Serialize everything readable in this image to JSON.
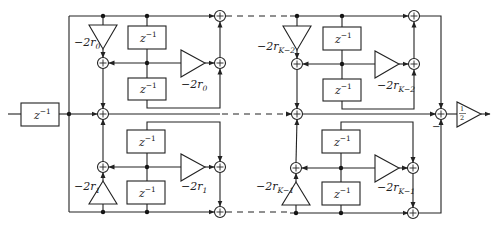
{
  "diagram": {
    "delay_label": "z",
    "delay_exp": "−1",
    "input_delay": {
      "base": "z",
      "exp": "−1"
    },
    "sections": [
      {
        "id": "upper-first",
        "delay_top": {
          "base": "z",
          "exp": "−1"
        },
        "delay_bottom": {
          "base": "z",
          "exp": "−1"
        },
        "gain_tri": {
          "prefix": "−2r",
          "sub": "0"
        },
        "gain_right": {
          "prefix": "−2r",
          "sub": "0"
        }
      },
      {
        "id": "upper-last",
        "delay_top": {
          "base": "z",
          "exp": "−1"
        },
        "delay_bottom": {
          "base": "z",
          "exp": "−1"
        },
        "gain_tri": {
          "prefix": "−2r",
          "sub": "K−2"
        },
        "gain_right": {
          "prefix": "−2r",
          "sub": "K−2"
        }
      },
      {
        "id": "lower-first",
        "delay_top": {
          "base": "z",
          "exp": "−1"
        },
        "delay_bottom": {
          "base": "z",
          "exp": "−1"
        },
        "gain_tri": {
          "prefix": "−2r",
          "sub": "1"
        },
        "gain_right": {
          "prefix": "−2r",
          "sub": "1"
        }
      },
      {
        "id": "lower-last",
        "delay_top": {
          "base": "z",
          "exp": "−1"
        },
        "delay_bottom": {
          "base": "z",
          "exp": "−1"
        },
        "gain_tri": {
          "prefix": "−2r",
          "sub": "K−1"
        },
        "gain_right": {
          "prefix": "−2r",
          "sub": "K−1"
        }
      }
    ],
    "output_gain": {
      "num": "1",
      "den": "2"
    },
    "minus_sign": "−",
    "adder_symbol": "+"
  }
}
